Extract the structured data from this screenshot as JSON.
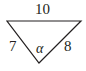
{
  "diagram": {
    "type": "triangle",
    "stroke_color": "#231f20",
    "sides": {
      "top": "10",
      "left": "7",
      "right": "8"
    },
    "angle_label": "α",
    "angle_vertex": "bottom"
  }
}
